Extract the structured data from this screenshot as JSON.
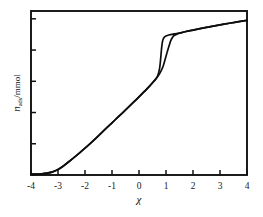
{
  "chart_data": {
    "type": "line",
    "title": "",
    "subtitle": "",
    "xlabel": "χ",
    "ylabel": "n_ads /mmol",
    "ylabel_parts": {
      "symbol": "n",
      "subscript": "ads",
      "unit": "/mmol"
    },
    "xlim": [
      -4,
      4
    ],
    "ylim": [
      0,
      1.05
    ],
    "grid": false,
    "legend": null,
    "legend_position": "none",
    "x_ticks": [
      -4,
      -3,
      -2,
      -1,
      0,
      1,
      2,
      3,
      4
    ],
    "x_tick_labels": [
      "-4",
      "-3",
      "-2",
      "-1",
      "0",
      "1",
      "2",
      "3",
      "4"
    ],
    "y_ticks": [
      0.0,
      0.2,
      0.4,
      0.6,
      0.8,
      1.0
    ],
    "y_tick_labels": [
      "",
      "",
      "",
      "",
      "",
      ""
    ],
    "annotations": [],
    "series": [
      {
        "name": "adsorption branch",
        "x": [
          -4.0,
          -3.6,
          -3.4,
          -3.2,
          -3.0,
          -2.8,
          -2.6,
          -2.4,
          -2.2,
          -2.0,
          -1.8,
          -1.6,
          -1.4,
          -1.2,
          -1.0,
          -0.8,
          -0.6,
          -0.4,
          -0.2,
          0.0,
          0.2,
          0.4,
          0.55,
          0.7,
          0.8,
          0.9,
          1.0,
          1.05,
          1.12,
          1.18,
          1.25,
          1.3,
          1.4,
          1.5,
          1.7,
          2.0,
          2.4,
          2.8,
          3.2,
          3.6,
          4.0
        ],
        "y": [
          0.005,
          0.008,
          0.012,
          0.02,
          0.035,
          0.058,
          0.085,
          0.113,
          0.142,
          0.172,
          0.203,
          0.235,
          0.268,
          0.301,
          0.334,
          0.367,
          0.4,
          0.433,
          0.466,
          0.5,
          0.535,
          0.571,
          0.6,
          0.632,
          0.66,
          0.7,
          0.76,
          0.79,
          0.83,
          0.862,
          0.884,
          0.893,
          0.902,
          0.908,
          0.917,
          0.928,
          0.942,
          0.955,
          0.967,
          0.979,
          0.99
        ]
      },
      {
        "name": "desorption branch",
        "x": [
          -4.0,
          -3.6,
          -3.4,
          -3.2,
          -3.0,
          -2.8,
          -2.6,
          -2.4,
          -2.2,
          -2.0,
          -1.8,
          -1.6,
          -1.4,
          -1.2,
          -1.0,
          -0.8,
          -0.6,
          -0.4,
          -0.2,
          0.0,
          0.2,
          0.4,
          0.55,
          0.68,
          0.76,
          0.8,
          0.83,
          0.86,
          0.9,
          0.95,
          1.0,
          1.1,
          1.3,
          1.5,
          1.7,
          2.0,
          2.4,
          2.8,
          3.2,
          3.6,
          4.0
        ],
        "y": [
          0.005,
          0.008,
          0.012,
          0.02,
          0.035,
          0.058,
          0.085,
          0.113,
          0.142,
          0.172,
          0.203,
          0.235,
          0.268,
          0.301,
          0.334,
          0.367,
          0.4,
          0.433,
          0.466,
          0.5,
          0.535,
          0.571,
          0.6,
          0.63,
          0.68,
          0.74,
          0.8,
          0.845,
          0.872,
          0.884,
          0.89,
          0.896,
          0.903,
          0.909,
          0.917,
          0.928,
          0.942,
          0.955,
          0.967,
          0.979,
          0.99
        ]
      }
    ]
  }
}
